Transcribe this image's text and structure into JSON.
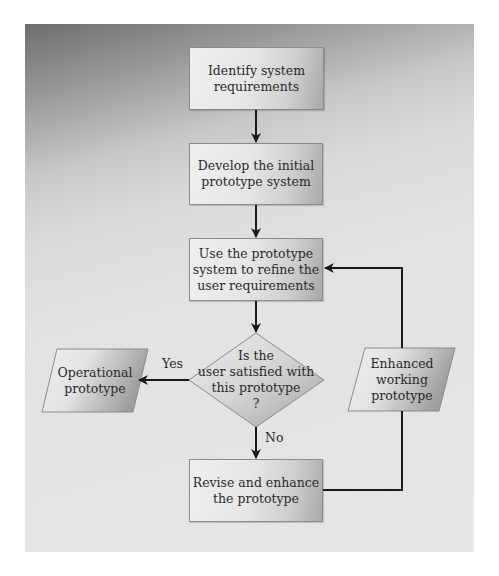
{
  "diagram": {
    "type": "flowchart",
    "colors": {
      "line": "#1a1a1a",
      "box_light": "#efefef",
      "box_dark": "#a9a9a9",
      "panel_dark": "#6e6e6e",
      "panel_light": "#e6e6e6"
    },
    "nodes": [
      {
        "id": "n1",
        "shape": "rectangle",
        "text": "Identify system\nrequirements"
      },
      {
        "id": "n2",
        "shape": "rectangle",
        "text": "Develop the initial\nprototype system"
      },
      {
        "id": "n3",
        "shape": "rectangle",
        "text": "Use the prototype\nsystem to refine the\nuser requirements"
      },
      {
        "id": "n4",
        "shape": "diamond",
        "text": "Is the\nuser satisfied with\nthis prototype\n?"
      },
      {
        "id": "n5",
        "shape": "parallelogram",
        "text": "Operational\nprototype"
      },
      {
        "id": "n6",
        "shape": "rectangle",
        "text": "Revise and enhance\nthe prototype"
      },
      {
        "id": "n7",
        "shape": "parallelogram",
        "text": "Enhanced\nworking\nprototype"
      }
    ],
    "edges": [
      {
        "from": "n1",
        "to": "n2",
        "label": ""
      },
      {
        "from": "n2",
        "to": "n3",
        "label": ""
      },
      {
        "from": "n3",
        "to": "n4",
        "label": ""
      },
      {
        "from": "n4",
        "to": "n5",
        "label": "Yes"
      },
      {
        "from": "n4",
        "to": "n6",
        "label": "No"
      },
      {
        "from": "n6",
        "to": "n7",
        "label": ""
      },
      {
        "from": "n7",
        "to": "n3",
        "label": ""
      }
    ],
    "labels": {
      "yes": "Yes",
      "no": "No"
    }
  }
}
